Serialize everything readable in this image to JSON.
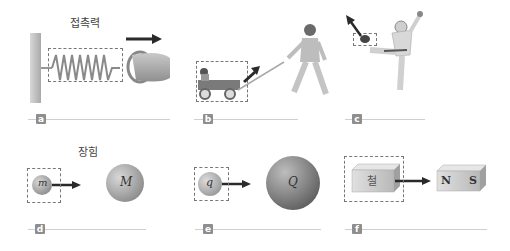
{
  "titles": {
    "contact": "접촉력",
    "field": "장힘"
  },
  "panels": [
    {
      "id": "a",
      "label": "a",
      "description": "spring pulled by hand"
    },
    {
      "id": "b",
      "label": "b",
      "description": "person pulling wagon"
    },
    {
      "id": "c",
      "label": "c",
      "description": "football kicked"
    },
    {
      "id": "d",
      "label": "d",
      "description": "gravitational mass attraction",
      "small_label": "m",
      "large_label": "M"
    },
    {
      "id": "e",
      "label": "e",
      "description": "electric charge attraction",
      "small_label": "q",
      "large_label": "Q"
    },
    {
      "id": "f",
      "label": "f",
      "description": "iron attracted to magnet",
      "block_label": "철",
      "magnet_n": "N",
      "magnet_s": "S"
    }
  ],
  "colors": {
    "arrow": "#2a2a2a",
    "dash": "#777777",
    "label_bg": "#8e8e8e",
    "line": "#cfcfcf"
  }
}
